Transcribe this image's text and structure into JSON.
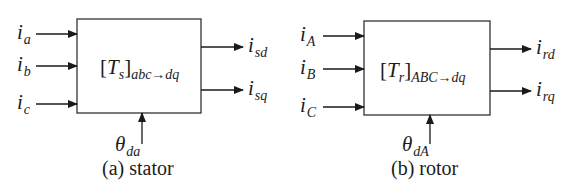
{
  "stator": {
    "inputs": [
      {
        "base": "i",
        "sub": "a"
      },
      {
        "base": "i",
        "sub": "b"
      },
      {
        "base": "i",
        "sub": "c"
      }
    ],
    "block": {
      "open": "[",
      "symbol": "T",
      "symbol_sub": "s",
      "close": "]",
      "sub": "abc→dq"
    },
    "outputs": [
      {
        "base": "i",
        "sub": "sd"
      },
      {
        "base": "i",
        "sub": "sq"
      }
    ],
    "angle": {
      "base": "θ",
      "sub": "da"
    },
    "caption": "(a) stator"
  },
  "rotor": {
    "inputs": [
      {
        "base": "i",
        "sub": "A"
      },
      {
        "base": "i",
        "sub": "B"
      },
      {
        "base": "i",
        "sub": "C"
      }
    ],
    "block": {
      "open": "[",
      "symbol": "T",
      "symbol_sub": "r",
      "close": "]",
      "sub": "ABC→dq"
    },
    "outputs": [
      {
        "base": "i",
        "sub": "rd"
      },
      {
        "base": "i",
        "sub": "rq"
      }
    ],
    "angle": {
      "base": "θ",
      "sub": "dA"
    },
    "caption": "(b) rotor"
  }
}
